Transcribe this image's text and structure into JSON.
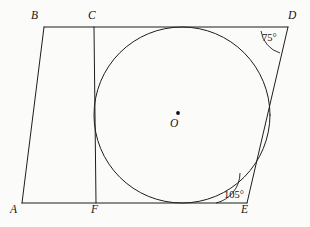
{
  "figure": {
    "kind": "geometry-diagram",
    "background_color": "#fbfbfa",
    "stroke_color": "#1d1d1d"
  },
  "points": [
    {
      "id": "B",
      "label": "B",
      "x": 44,
      "y": 27,
      "label_x": 31,
      "label_y": 10
    },
    {
      "id": "C",
      "label": "C",
      "x": 94,
      "y": 27,
      "label_x": 88,
      "label_y": 10
    },
    {
      "id": "D",
      "label": "D",
      "x": 288,
      "y": 27,
      "label_x": 288,
      "label_y": 10
    },
    {
      "id": "A",
      "label": "A",
      "x": 22,
      "y": 203,
      "label_x": 10,
      "label_y": 204
    },
    {
      "id": "F",
      "label": "F",
      "x": 96,
      "y": 203,
      "label_x": 91,
      "label_y": 204
    },
    {
      "id": "E",
      "label": "E",
      "x": 247,
      "y": 203,
      "label_x": 241,
      "label_y": 204
    },
    {
      "id": "O",
      "label": "O",
      "x": 182,
      "y": 115,
      "label_x": 170,
      "label_y": 118
    }
  ],
  "segments": [
    {
      "id": "BD",
      "from": "B",
      "to": "D",
      "name": "top-side-bd"
    },
    {
      "id": "AE",
      "from": "A",
      "to": "E",
      "name": "bottom-side-ae"
    },
    {
      "id": "AB",
      "from": "A",
      "to": "B",
      "name": "left-side-ab"
    },
    {
      "id": "DE",
      "from": "D",
      "to": "E",
      "name": "right-side-de"
    },
    {
      "id": "CF",
      "from": "C",
      "to": "F",
      "name": "chord-cf"
    }
  ],
  "circle": {
    "center_x": 182,
    "center_y": 115,
    "radius": 88,
    "center_dot_x": 178,
    "center_dot_y": 113,
    "center_dot_r": 1.9,
    "center_label": "O"
  },
  "angles": [
    {
      "id": "angle-d",
      "value": "75°",
      "vertex": "D",
      "label_x": 262,
      "label_y": 33,
      "arc_path": "M 261 31 A 27 27 0 0 0 280 53"
    },
    {
      "id": "angle-e",
      "value": "105°",
      "vertex": "E",
      "label_x": 224,
      "label_y": 190,
      "arc_path": "M 216 203 A 31 31 0 0 0 240 173"
    }
  ]
}
